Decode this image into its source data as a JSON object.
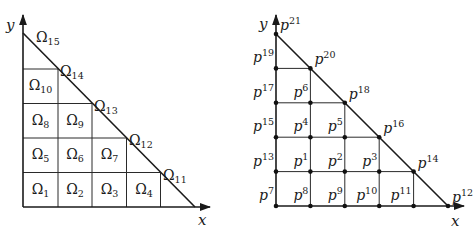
{
  "left_diagram": {
    "axis_x_label": "x",
    "axis_y_label": "y",
    "cells": [
      {
        "name": "Ω",
        "sub": "1",
        "cx": 40.5,
        "cy": 190
      },
      {
        "name": "Ω",
        "sub": "2",
        "cx": 75,
        "cy": 190
      },
      {
        "name": "Ω",
        "sub": "3",
        "cx": 109.5,
        "cy": 190
      },
      {
        "name": "Ω",
        "sub": "4",
        "cx": 144,
        "cy": 190
      },
      {
        "name": "Ω",
        "sub": "5",
        "cx": 40.5,
        "cy": 155
      },
      {
        "name": "Ω",
        "sub": "6",
        "cx": 75,
        "cy": 155
      },
      {
        "name": "Ω",
        "sub": "7",
        "cx": 109.5,
        "cy": 155
      },
      {
        "name": "Ω",
        "sub": "8",
        "cx": 40.5,
        "cy": 121
      },
      {
        "name": "Ω",
        "sub": "9",
        "cx": 75,
        "cy": 121
      },
      {
        "name": "Ω",
        "sub": "10",
        "cx": 40.5,
        "cy": 86
      }
    ],
    "boundary_labels": [
      {
        "name": "Ω",
        "sub": "11",
        "x": 163,
        "y": 180
      },
      {
        "name": "Ω",
        "sub": "12",
        "x": 129,
        "y": 145
      },
      {
        "name": "Ω",
        "sub": "13",
        "x": 94,
        "y": 111
      },
      {
        "name": "Ω",
        "sub": "14",
        "x": 60,
        "y": 76
      },
      {
        "name": "Ω",
        "sub": "15",
        "x": 36,
        "y": 42
      }
    ]
  },
  "right_diagram": {
    "axis_x_label": "x",
    "axis_y_label": "y",
    "points": [
      {
        "label": "p",
        "sup": "1",
        "col": 1,
        "row": 1
      },
      {
        "label": "p",
        "sup": "2",
        "col": 2,
        "row": 1
      },
      {
        "label": "p",
        "sup": "3",
        "col": 3,
        "row": 1
      },
      {
        "label": "p",
        "sup": "4",
        "col": 1,
        "row": 2
      },
      {
        "label": "p",
        "sup": "5",
        "col": 2,
        "row": 2
      },
      {
        "label": "p",
        "sup": "6",
        "col": 1,
        "row": 3
      },
      {
        "label": "p",
        "sup": "7",
        "col": 0,
        "row": 0
      },
      {
        "label": "p",
        "sup": "8",
        "col": 1,
        "row": 0
      },
      {
        "label": "p",
        "sup": "9",
        "col": 2,
        "row": 0
      },
      {
        "label": "p",
        "sup": "10",
        "col": 3,
        "row": 0
      },
      {
        "label": "p",
        "sup": "11",
        "col": 4,
        "row": 0
      },
      {
        "label": "p",
        "sup": "12",
        "col": 5,
        "row": 0
      },
      {
        "label": "p",
        "sup": "13",
        "col": 0,
        "row": 1
      },
      {
        "label": "p",
        "sup": "14",
        "col": 4,
        "row": 1
      },
      {
        "label": "p",
        "sup": "15",
        "col": 0,
        "row": 2
      },
      {
        "label": "p",
        "sup": "16",
        "col": 3,
        "row": 2
      },
      {
        "label": "p",
        "sup": "17",
        "col": 0,
        "row": 3
      },
      {
        "label": "p",
        "sup": "18",
        "col": 2,
        "row": 3
      },
      {
        "label": "p",
        "sup": "19",
        "col": 0,
        "row": 4
      },
      {
        "label": "p",
        "sup": "20",
        "col": 1,
        "row": 4
      },
      {
        "label": "p",
        "sup": "21",
        "col": 0,
        "row": 5
      }
    ]
  }
}
